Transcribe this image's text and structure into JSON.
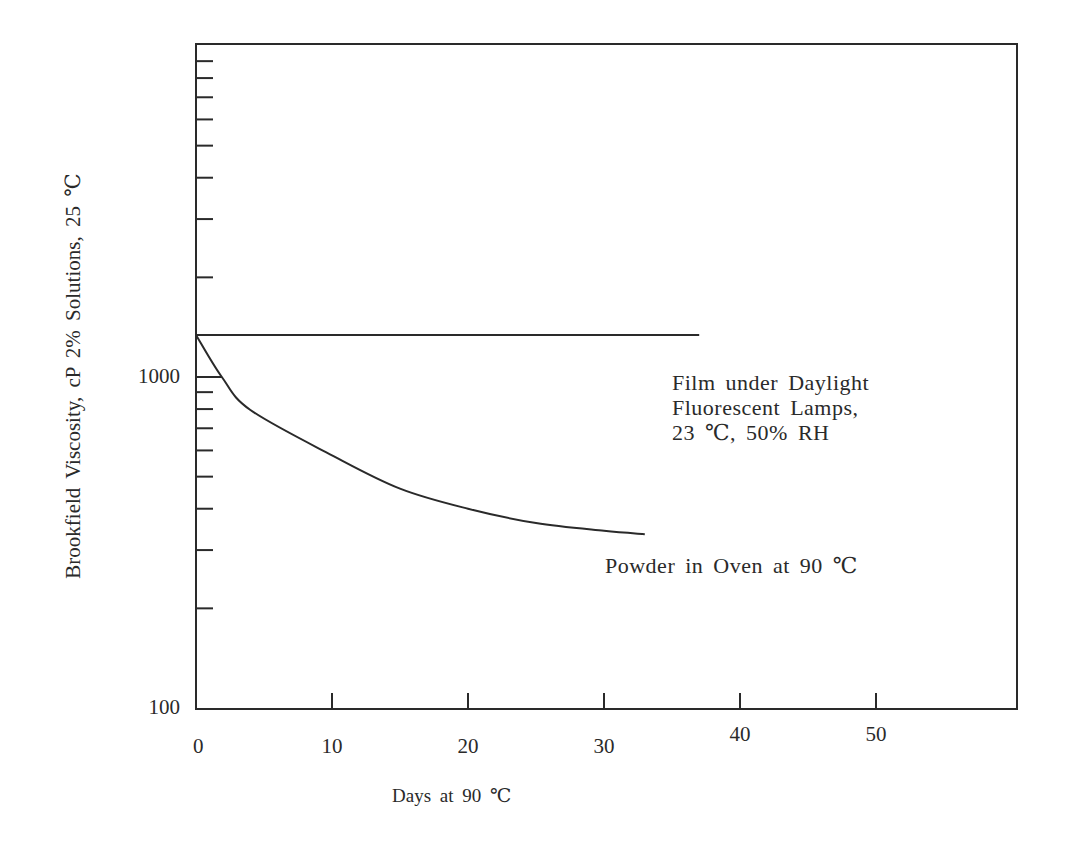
{
  "chart_data": {
    "type": "line",
    "title": "",
    "xlabel": "Days at 90 ℃",
    "ylabel": "Brookfield Viscosity, cP 2% Solutions, 25 ℃",
    "xscale": "linear",
    "yscale": "log",
    "xlim": [
      0,
      60
    ],
    "ylim": [
      100,
      10000
    ],
    "x_ticks": [
      0,
      10,
      20,
      30,
      40,
      50
    ],
    "x_tick_labels": [
      "0",
      "10",
      "20",
      "30",
      "40",
      "50"
    ],
    "y_tick_labels": [
      "100",
      "1000"
    ],
    "y_minor_ticks": [
      200,
      300,
      400,
      500,
      600,
      700,
      800,
      900,
      2000,
      3000,
      4000,
      5000,
      6000,
      7000,
      8000,
      9000
    ],
    "grid": false,
    "legend": "inline annotations",
    "series": [
      {
        "name": "Film under Daylight Fluorescent Lamps, 23 ℃, 50% RH",
        "x": [
          0,
          37
        ],
        "values": [
          1340,
          1340
        ]
      },
      {
        "name": "Powder in Oven at 90 ℃",
        "x": [
          0,
          1.9,
          4,
          10,
          15,
          20,
          25,
          30,
          33
        ],
        "values": [
          1340,
          1000,
          795,
          580,
          460,
          400,
          362,
          343,
          335
        ]
      }
    ]
  },
  "annotations": {
    "film_line1": "Film under Daylight",
    "film_line2": "Fluorescent Lamps,",
    "film_line3": "23 ℃, 50% RH",
    "powder": "Powder in Oven at 90 ℃"
  }
}
